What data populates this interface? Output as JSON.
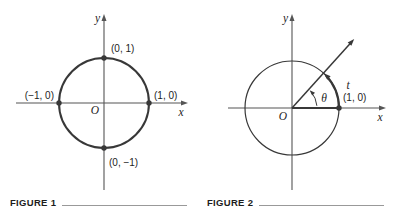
{
  "colors": {
    "background": "#ffffff",
    "ink": "#383838",
    "axis": "#555555",
    "text": "#1d1d1d",
    "rule": "#999999"
  },
  "figure1": {
    "caption": "FIGURE 1",
    "x_axis_label": "x",
    "y_axis_label": "y",
    "origin_label": "O",
    "points": {
      "top": "(0, 1)",
      "left": "(−1, 0)",
      "right": "(1, 0)",
      "bottom": "(0, −1)"
    }
  },
  "figure2": {
    "caption": "FIGURE 2",
    "x_axis_label": "x",
    "y_axis_label": "y",
    "origin_label": "O",
    "angle_label": "θ",
    "arc_label": "t",
    "point_right": "(1, 0)"
  }
}
